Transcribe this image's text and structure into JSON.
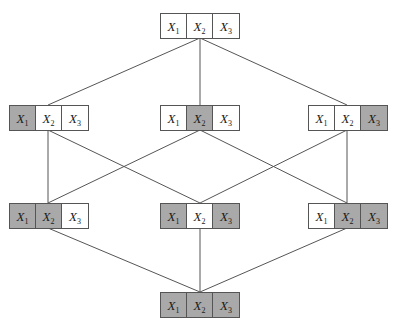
{
  "diagram": {
    "title": "",
    "type": "hasse-lattice",
    "variable_base": "X",
    "variable_subscripts": [
      "1",
      "2",
      "3"
    ],
    "colors": {
      "shaded_cell": "#a9a9a9",
      "unshaded_cell": "#ffffff",
      "border": "#555555",
      "edge": "#555555",
      "background": "#ffffff",
      "text": "#1a1a1a"
    },
    "nodes": [
      {
        "id": "node-top",
        "name": "empty-set-node",
        "level": 0,
        "x": 160,
        "y": 13,
        "cells": [
          {
            "label": "X",
            "sub": "1",
            "shaded": false
          },
          {
            "label": "X",
            "sub": "2",
            "shaded": false
          },
          {
            "label": "X",
            "sub": "3",
            "shaded": false
          }
        ]
      },
      {
        "id": "node-mid-left",
        "name": "x1-node",
        "level": 1,
        "x": 9,
        "y": 105,
        "cells": [
          {
            "label": "X",
            "sub": "1",
            "shaded": true
          },
          {
            "label": "X",
            "sub": "2",
            "shaded": false
          },
          {
            "label": "X",
            "sub": "3",
            "shaded": false
          }
        ]
      },
      {
        "id": "node-mid-center",
        "name": "x2-node",
        "level": 1,
        "x": 160,
        "y": 105,
        "cells": [
          {
            "label": "X",
            "sub": "1",
            "shaded": false
          },
          {
            "label": "X",
            "sub": "2",
            "shaded": true
          },
          {
            "label": "X",
            "sub": "3",
            "shaded": false
          }
        ]
      },
      {
        "id": "node-mid-right",
        "name": "x3-node",
        "level": 1,
        "x": 308,
        "y": 105,
        "cells": [
          {
            "label": "X",
            "sub": "1",
            "shaded": false
          },
          {
            "label": "X",
            "sub": "2",
            "shaded": false
          },
          {
            "label": "X",
            "sub": "3",
            "shaded": true
          }
        ]
      },
      {
        "id": "node-low-left",
        "name": "x1-x2-node",
        "level": 2,
        "x": 9,
        "y": 203,
        "cells": [
          {
            "label": "X",
            "sub": "1",
            "shaded": true
          },
          {
            "label": "X",
            "sub": "2",
            "shaded": true
          },
          {
            "label": "X",
            "sub": "3",
            "shaded": false
          }
        ]
      },
      {
        "id": "node-low-center",
        "name": "x1-x3-node",
        "level": 2,
        "x": 160,
        "y": 203,
        "cells": [
          {
            "label": "X",
            "sub": "1",
            "shaded": true
          },
          {
            "label": "X",
            "sub": "2",
            "shaded": false
          },
          {
            "label": "X",
            "sub": "3",
            "shaded": true
          }
        ]
      },
      {
        "id": "node-low-right",
        "name": "x2-x3-node",
        "level": 2,
        "x": 308,
        "y": 203,
        "cells": [
          {
            "label": "X",
            "sub": "1",
            "shaded": false
          },
          {
            "label": "X",
            "sub": "2",
            "shaded": true
          },
          {
            "label": "X",
            "sub": "3",
            "shaded": true
          }
        ]
      },
      {
        "id": "node-bottom",
        "name": "full-set-node",
        "level": 3,
        "x": 160,
        "y": 292,
        "cells": [
          {
            "label": "X",
            "sub": "1",
            "shaded": true
          },
          {
            "label": "X",
            "sub": "2",
            "shaded": true
          },
          {
            "label": "X",
            "sub": "3",
            "shaded": true
          }
        ]
      }
    ],
    "edges": [
      {
        "name": "edge-top-to-mid-left",
        "x1": 200,
        "y1": 38,
        "x2": 48,
        "y2": 105
      },
      {
        "name": "edge-top-to-mid-center",
        "x1": 200,
        "y1": 38,
        "x2": 200,
        "y2": 105
      },
      {
        "name": "edge-top-to-mid-right",
        "x1": 200,
        "y1": 38,
        "x2": 347,
        "y2": 105
      },
      {
        "name": "edge-mid-left-to-low-left",
        "x1": 48,
        "y1": 130,
        "x2": 48,
        "y2": 203
      },
      {
        "name": "edge-mid-left-to-low-center",
        "x1": 48,
        "y1": 130,
        "x2": 200,
        "y2": 203
      },
      {
        "name": "edge-mid-center-to-low-left",
        "x1": 200,
        "y1": 130,
        "x2": 48,
        "y2": 203
      },
      {
        "name": "edge-mid-center-to-low-right",
        "x1": 200,
        "y1": 130,
        "x2": 347,
        "y2": 203
      },
      {
        "name": "edge-mid-right-to-low-center",
        "x1": 347,
        "y1": 130,
        "x2": 200,
        "y2": 203
      },
      {
        "name": "edge-mid-right-to-low-right",
        "x1": 347,
        "y1": 130,
        "x2": 347,
        "y2": 203
      },
      {
        "name": "edge-low-left-to-bottom",
        "x1": 48,
        "y1": 228,
        "x2": 200,
        "y2": 292
      },
      {
        "name": "edge-low-center-to-bottom",
        "x1": 200,
        "y1": 228,
        "x2": 200,
        "y2": 292
      },
      {
        "name": "edge-low-right-to-bottom",
        "x1": 347,
        "y1": 228,
        "x2": 200,
        "y2": 292
      }
    ]
  }
}
